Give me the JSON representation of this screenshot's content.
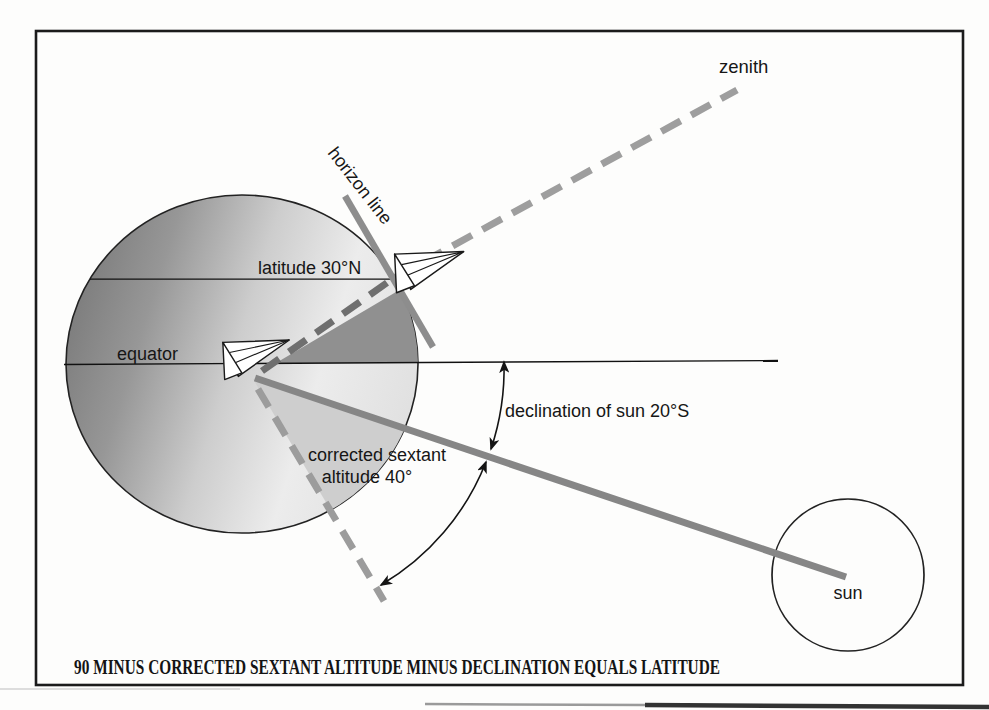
{
  "diagram": {
    "type": "celestial-navigation-latitude-figure",
    "labels": {
      "zenith": "zenith",
      "horizon_line": "horizon line",
      "latitude": "latitude 30°N",
      "equator": "equator",
      "declination": "declination of sun 20°S",
      "sextant_line1": "corrected sextant",
      "sextant_line2": "altitude 40°",
      "sun": "sun"
    },
    "caption": "90 MINUS CORRECTED SEXTANT ALTITUDE MINUS DECLINATION EQUALS LATITUDE",
    "values": {
      "latitude": "30°N",
      "declination_of_sun": "20°S",
      "corrected_sextant_altitude": "40°",
      "zenith_to_horizon": "90"
    },
    "colors": {
      "ink": "#1a1a1a",
      "thick_line_gray": "#868686",
      "horizon_gray": "#8d8d8d",
      "dash_gray": "#9c9c9c",
      "dash_dark_gray": "#6f6f6f",
      "latitude_wedge": "#909090",
      "altitude_wedge": "#cecece",
      "globe_dark": "#7e7e7e",
      "globe_light": "#eeeeee",
      "paper": "#fdfdfc"
    },
    "icons": [
      "sailboat-icon",
      "sun-circle",
      "arrow-arc"
    ]
  }
}
